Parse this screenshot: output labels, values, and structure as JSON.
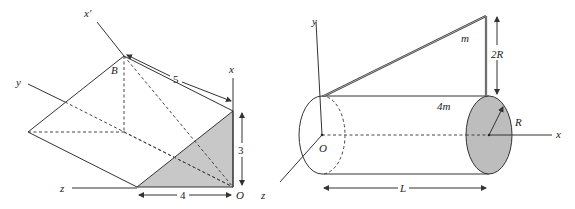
{
  "figure_left": {
    "labels": {
      "x_prime": "x′",
      "x": "x",
      "y": "y",
      "z": "z",
      "B": "B",
      "O": "O"
    },
    "dimensions": {
      "hypotenuse": "5",
      "height": "3",
      "base": "4"
    },
    "colors": {
      "shaded_face": "#c8c8c8",
      "line": "#333333"
    }
  },
  "figure_right": {
    "labels": {
      "y": "y",
      "x": "x",
      "z": "z",
      "O": "O",
      "rod_mass": "m",
      "cylinder_mass": "4m",
      "rod_height": "2R",
      "radius": "R",
      "length": "L"
    },
    "colors": {
      "end_cap": "#bdbdbd",
      "line": "#333333"
    }
  }
}
